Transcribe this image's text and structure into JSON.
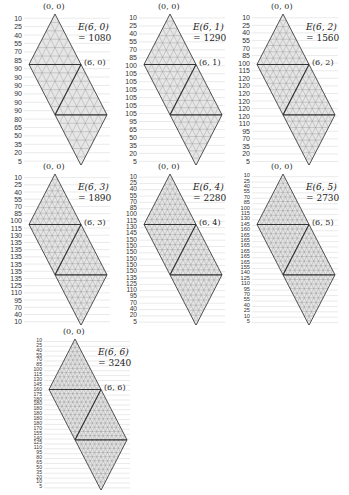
{
  "figure": {
    "panels": [
      {
        "n": 6,
        "k": 0,
        "origin_label": "(0, 0)",
        "corner_label": "(6, 0)",
        "energy_label": "E(6, 0)",
        "energy_value": "= 1080",
        "row_labels": [
          "10",
          "25",
          "40",
          "55",
          "70",
          "85",
          "90",
          "90",
          "90",
          "90",
          "90",
          "90",
          "80",
          "65",
          "50",
          "35",
          "20",
          "5"
        ]
      },
      {
        "n": 6,
        "k": 1,
        "origin_label": "(0, 0)",
        "corner_label": "(6, 1)",
        "energy_label": "E(6, 1)",
        "energy_value": "= 1290",
        "row_labels": [
          "10",
          "25",
          "40",
          "55",
          "70",
          "85",
          "100",
          "105",
          "105",
          "105",
          "105",
          "105",
          "105",
          "95",
          "65",
          "50",
          "35",
          "20",
          "5"
        ]
      },
      {
        "n": 6,
        "k": 2,
        "origin_label": "(0, 0)",
        "corner_label": "(6, 2)",
        "energy_label": "E(6, 2)",
        "energy_value": "= 1560",
        "row_labels": [
          "10",
          "25",
          "40",
          "55",
          "70",
          "85",
          "100",
          "115",
          "120",
          "120",
          "120",
          "120",
          "120",
          "120",
          "110",
          "95",
          "70",
          "35",
          "20",
          "5"
        ]
      },
      {
        "n": 6,
        "k": 3,
        "origin_label": "(0, 0)",
        "corner_label": "(6, 3)",
        "energy_label": "E(6, 3)",
        "energy_value": "= 1890",
        "row_labels": [
          "10",
          "25",
          "40",
          "55",
          "70",
          "85",
          "100",
          "115",
          "130",
          "135",
          "135",
          "135",
          "135",
          "135",
          "135",
          "125",
          "110",
          "95",
          "70",
          "40",
          "10"
        ]
      },
      {
        "n": 6,
        "k": 4,
        "origin_label": "(0, 0)",
        "corner_label": "(6, 4)",
        "energy_label": "E(6, 4)",
        "energy_value": "= 2280",
        "row_labels": [
          "10",
          "25",
          "40",
          "55",
          "70",
          "85",
          "100",
          "115",
          "130",
          "145",
          "150",
          "150",
          "150",
          "150",
          "150",
          "150",
          "135",
          "125",
          "110",
          "95",
          "70",
          "40",
          "20",
          "5"
        ]
      },
      {
        "n": 6,
        "k": 5,
        "origin_label": "(0, 0)",
        "corner_label": "(6, 5)",
        "energy_label": "E(6, 5)",
        "energy_value": "= 2730",
        "row_labels": [
          "10",
          "25",
          "40",
          "55",
          "70",
          "85",
          "100",
          "115",
          "130",
          "145",
          "160",
          "165",
          "165",
          "165",
          "165",
          "165",
          "165",
          "155",
          "140",
          "125",
          "110",
          "95",
          "70",
          "55",
          "40",
          "25",
          "10",
          "5"
        ]
      },
      {
        "n": 6,
        "k": 6,
        "origin_label": "(0, 0)",
        "corner_label": "(6, 6)",
        "energy_label": "E(6, 6)",
        "energy_value": "= 3240",
        "row_labels": [
          "10",
          "25",
          "40",
          "55",
          "70",
          "85",
          "100",
          "115",
          "130",
          "145",
          "160",
          "175",
          "180",
          "180",
          "180",
          "180",
          "180",
          "180",
          "170",
          "155",
          "140",
          "125",
          "110",
          "95",
          "80",
          "65",
          "50",
          "35",
          "20",
          "10",
          "5"
        ]
      }
    ]
  },
  "colors": {
    "outline": "#333333",
    "grid": "#8a8a8a",
    "fill": "#e6e6e6",
    "guide": "#d4d4d4",
    "text": "#222222"
  }
}
